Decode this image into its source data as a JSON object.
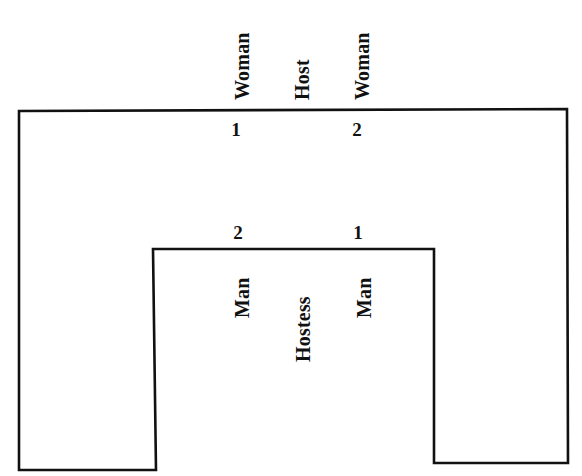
{
  "figure": {
    "type": "seating-diagram",
    "shape": "inverted-u-table",
    "background_color": "#ffffff",
    "line_color": "#111111"
  },
  "top_side": {
    "labels": [
      {
        "text": "Woman",
        "seat_number": "1"
      },
      {
        "text": "Host",
        "seat_number": ""
      },
      {
        "text": "Woman",
        "seat_number": "2"
      }
    ]
  },
  "inner_side": {
    "labels": [
      {
        "text": "Man",
        "seat_number": "2"
      },
      {
        "text": "Hostess",
        "seat_number": ""
      },
      {
        "text": "Man",
        "seat_number": "1"
      }
    ]
  }
}
